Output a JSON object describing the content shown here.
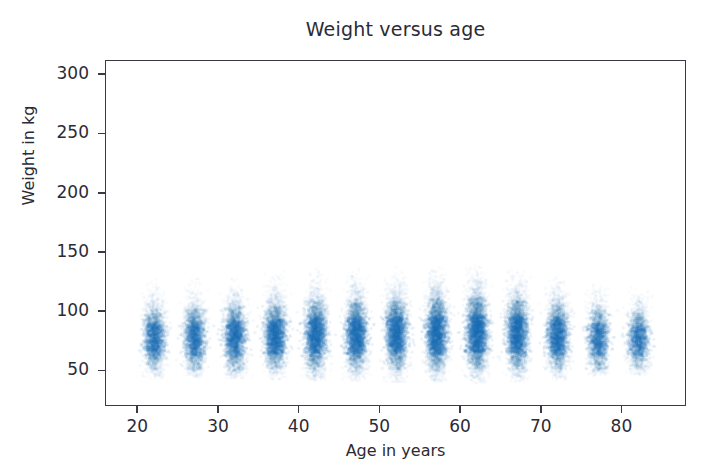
{
  "chart_data": {
    "type": "scatter",
    "title": "Weight versus age",
    "xlabel": "Age in years",
    "ylabel": "Weight in kg",
    "xlim": [
      16,
      88
    ],
    "ylim": [
      20,
      312
    ],
    "xticks": [
      20,
      30,
      40,
      50,
      60,
      70,
      80
    ],
    "xtick_labels": [
      "20",
      "30",
      "40",
      "50",
      "60",
      "70",
      "80"
    ],
    "yticks": [
      50,
      100,
      150,
      200,
      250,
      300
    ],
    "ytick_labels": [
      "50",
      "100",
      "150",
      "200",
      "250",
      "300"
    ],
    "grid": false,
    "legend": null,
    "marker_color": "#1f77b4",
    "marker_alpha": 0.035,
    "marker_size_px": 3.2,
    "x": [
      22,
      27,
      32,
      37,
      42,
      47,
      52,
      57,
      62,
      67,
      72,
      77,
      82
    ],
    "categories": [
      "22",
      "27",
      "32",
      "37",
      "42",
      "47",
      "52",
      "57",
      "62",
      "67",
      "72",
      "77",
      "82"
    ],
    "series": [
      {
        "name": "Weight in kg",
        "stat": "mean",
        "values": [
          77,
          77,
          78,
          79,
          80,
          80,
          81,
          81,
          82,
          81,
          79,
          77,
          76
        ]
      },
      {
        "name": "Weight spread (std dev, kg)",
        "stat": "std",
        "values": [
          16,
          16,
          17,
          17,
          18,
          18,
          18,
          19,
          19,
          18,
          17,
          16,
          15
        ]
      },
      {
        "name": "Cluster lower whisker (kg)",
        "stat": "min",
        "values": [
          44,
          45,
          44,
          43,
          42,
          42,
          41,
          41,
          40,
          41,
          43,
          46,
          47
        ]
      },
      {
        "name": "Cluster upper whisker (kg)",
        "stat": "max",
        "values": [
          130,
          131,
          133,
          135,
          137,
          137,
          138,
          139,
          140,
          138,
          132,
          126,
          122
        ]
      },
      {
        "name": "Points per age group",
        "stat": "count",
        "values": [
          2100,
          2200,
          2500,
          2800,
          3000,
          3000,
          3100,
          3300,
          3500,
          3100,
          2600,
          1900,
          1700
        ]
      }
    ]
  },
  "axes": {
    "tick_color": "#3a3a46",
    "spine_color": "#3a3a46",
    "background": "#ffffff"
  }
}
